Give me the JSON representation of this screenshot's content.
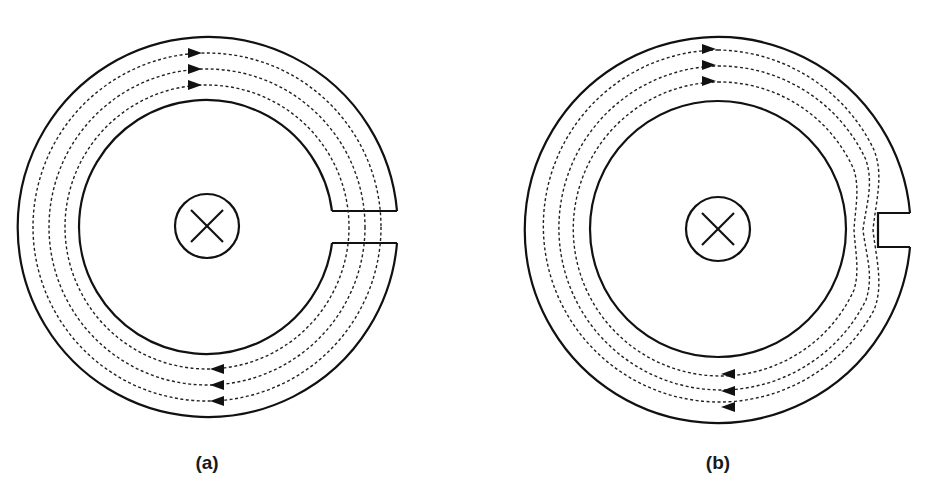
{
  "figure": {
    "panels": [
      {
        "id": "a",
        "label": "(a)",
        "description": "Toroidal core with an air gap cutting fully through the core; flux lines cross the gap",
        "gap_type": "full-gap",
        "current_symbol": "conductor-into-page-x",
        "flux_lines": 3,
        "flux_direction": "clockwise"
      },
      {
        "id": "b",
        "label": "(b)",
        "description": "Toroidal core with a partial notch on the outer edge; flux lines squeeze around the notch",
        "gap_type": "partial-notch",
        "current_symbol": "conductor-into-page-x",
        "flux_lines": 3,
        "flux_direction": "clockwise"
      }
    ],
    "colors": {
      "line": "#111111",
      "background": "#ffffff"
    }
  }
}
